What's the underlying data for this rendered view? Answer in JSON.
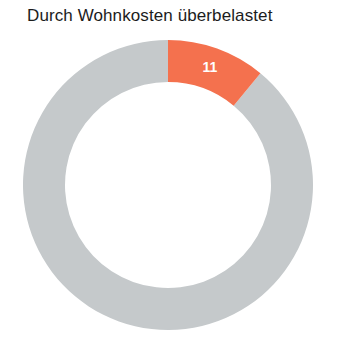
{
  "chart_data": {
    "type": "pie",
    "variant": "donut",
    "title": "Durch Wohnkosten überbelastet",
    "subtitle": "",
    "xlabel": "",
    "ylabel": "",
    "unit": "%",
    "total": 100,
    "legend": "none",
    "grid": false,
    "categories": [
      "Durch Wohnkosten überbelastet",
      "Übrige"
    ],
    "values": [
      11,
      89
    ],
    "labels_shown": [
      "11",
      ""
    ],
    "colors": [
      "#F4714E",
      "#C5C9CB"
    ],
    "series": [
      {
        "name": "Anteil",
        "values": [
          11,
          89
        ]
      }
    ],
    "slices": [
      {
        "name": "Durch Wohnkosten überbelastet",
        "value": 11,
        "label": "11",
        "color": "#F4714E",
        "start_angle_deg": 0,
        "end_angle_deg": 39.6,
        "label_color": "#FFFFFF"
      },
      {
        "name": "Übrige",
        "value": 89,
        "label": "",
        "color": "#C5C9CB",
        "start_angle_deg": 39.6,
        "end_angle_deg": 360,
        "label_color": "#FFFFFF"
      }
    ],
    "geometry": {
      "center_x": 168,
      "center_y": 155,
      "outer_radius": 145,
      "inner_radius": 103,
      "start_at_deg": 0,
      "direction": "clockwise"
    },
    "label_positions": [
      {
        "label": "11",
        "x": 213,
        "y": 40
      }
    ]
  },
  "page": {
    "background_color": "#FFFFFF",
    "title_color": "#1C1C1C"
  }
}
